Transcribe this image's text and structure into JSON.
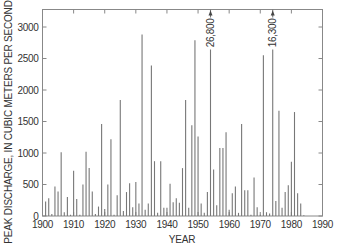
{
  "chart_data": {
    "type": "bar",
    "title": "",
    "xlabel": "YEAR",
    "ylabel": "PEAK DISCHARGE, IN CUBIC METERS PER SECOND",
    "xlim": [
      1900,
      1990
    ],
    "ylim": [
      0,
      3200
    ],
    "xticks": [
      1900,
      1910,
      1920,
      1930,
      1940,
      1950,
      1960,
      1970,
      1980,
      1990
    ],
    "yticks": [
      0,
      500,
      1000,
      1500,
      2000,
      2500,
      3000
    ],
    "grid": false,
    "legend": null,
    "series": [
      {
        "name": "Annual peak discharge",
        "x": [
          1901,
          1902,
          1903,
          1904,
          1905,
          1906,
          1907,
          1908,
          1909,
          1910,
          1911,
          1912,
          1913,
          1914,
          1915,
          1916,
          1917,
          1918,
          1919,
          1920,
          1921,
          1922,
          1923,
          1924,
          1925,
          1926,
          1927,
          1928,
          1929,
          1930,
          1931,
          1932,
          1933,
          1934,
          1935,
          1936,
          1937,
          1938,
          1939,
          1940,
          1941,
          1942,
          1943,
          1944,
          1945,
          1946,
          1947,
          1948,
          1949,
          1950,
          1951,
          1952,
          1953,
          1954,
          1955,
          1956,
          1957,
          1958,
          1959,
          1960,
          1961,
          1962,
          1963,
          1964,
          1965,
          1966,
          1967,
          1968,
          1969,
          1970,
          1971,
          1972,
          1973,
          1974,
          1975,
          1976,
          1977,
          1978,
          1979,
          1980,
          1981,
          1982,
          1983,
          1984
        ],
        "values": [
          230,
          280,
          30,
          470,
          390,
          1010,
          60,
          300,
          20,
          720,
          270,
          20,
          500,
          1020,
          760,
          390,
          30,
          150,
          1460,
          110,
          500,
          1220,
          20,
          330,
          1840,
          80,
          380,
          520,
          140,
          540,
          200,
          2880,
          100,
          200,
          2390,
          870,
          50,
          870,
          130,
          130,
          510,
          220,
          280,
          210,
          760,
          1840,
          130,
          1440,
          2790,
          1260,
          200,
          50,
          380,
          26800,
          740,
          170,
          1080,
          1080,
          1330,
          100,
          360,
          470,
          50,
          1460,
          410,
          410,
          20,
          610,
          140,
          20,
          2550,
          60,
          40,
          16300,
          240,
          1670,
          130,
          380,
          490,
          860,
          1650,
          360,
          200,
          10
        ]
      }
    ],
    "annotations": [
      {
        "year": 1954,
        "label": "26,800",
        "note": "off-scale peak, arrow"
      },
      {
        "year": 1974,
        "label": "16,300",
        "note": "off-scale peak, arrow"
      }
    ]
  },
  "labels": {
    "xlabel": "YEAR",
    "ylabel": "PEAK DISCHARGE, IN CUBIC METERS PER SECOND"
  }
}
